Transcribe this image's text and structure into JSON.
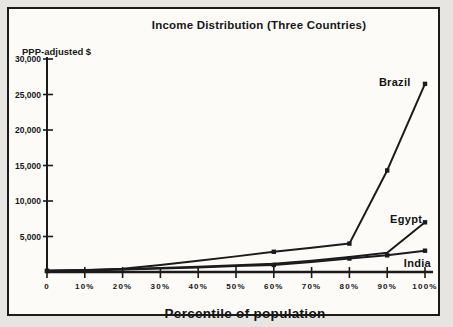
{
  "page": {
    "title": "Income Distribution (Three Countries)"
  },
  "chart_data": {
    "type": "line",
    "title": "Income Distribution (Three Countries)",
    "ylabel": "PPP-adjusted $",
    "xlabel": "Percentile of population",
    "x": [
      0,
      10,
      20,
      30,
      40,
      50,
      60,
      70,
      80,
      90,
      100
    ],
    "x_tick_labels": [
      "0",
      "10%",
      "20%",
      "30%",
      "40%",
      "50%",
      "60%",
      "70%",
      "80%",
      "90%",
      "100%"
    ],
    "y_ticks": [
      5000,
      10000,
      15000,
      20000,
      25000,
      30000
    ],
    "y_tick_labels": [
      "5,000",
      "10,000",
      "15,000",
      "20,000",
      "25,000",
      "30,000"
    ],
    "ylim": [
      0,
      30000
    ],
    "grid": false,
    "legend": "inline-labels",
    "line_color": "#1b1b1b",
    "background_color": "#fcfbf8",
    "series": [
      {
        "name": "Brazil",
        "values": [
          150,
          250,
          450,
          1000,
          1600,
          2200,
          2850,
          3400,
          4000,
          14300,
          26500
        ],
        "marker_indices": [
          0,
          6,
          8,
          9,
          10
        ]
      },
      {
        "name": "Egypt",
        "values": [
          200,
          280,
          400,
          550,
          750,
          950,
          1150,
          1600,
          2100,
          2700,
          7000
        ],
        "marker_indices": [
          10
        ]
      },
      {
        "name": "India",
        "values": [
          150,
          220,
          350,
          500,
          650,
          850,
          1000,
          1400,
          1900,
          2350,
          3000
        ],
        "marker_indices": [
          0,
          6,
          8,
          9,
          10
        ]
      }
    ],
    "annotations": [
      {
        "text": "Brazil",
        "x_pct": 92,
        "y_val": 26700
      },
      {
        "text": "Egypt",
        "x_pct": 95,
        "y_val": 7500
      },
      {
        "text": "India",
        "x_pct": 98,
        "y_val": 1300
      }
    ]
  }
}
